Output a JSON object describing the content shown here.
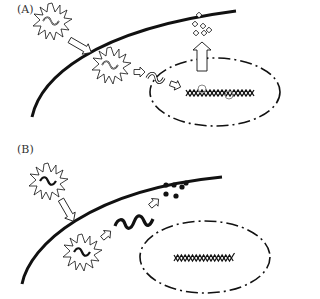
{
  "panels": [
    {
      "label": "(A)",
      "description": "Virus particle enters cell, releases genome which integrates into host DNA in nucleus; progeny particles released",
      "elements": [
        "virus-particle-outside",
        "entry-arrow",
        "virus-particle-inside",
        "genome-release-arrow",
        "viral-genome",
        "nuclear-entry-arrow",
        "host-dna-with-integration",
        "export-arrow",
        "progeny-particles"
      ]
    },
    {
      "label": "(B)",
      "description": "Virus particle enters cell, releases genome which is degraded in cytoplasm; host DNA in nucleus unchanged",
      "elements": [
        "virus-particle-outside",
        "entry-arrow",
        "virus-particle-inside",
        "genome-release-arrow",
        "viral-genome",
        "degradation-arrow",
        "degraded-fragments",
        "host-dna"
      ]
    }
  ],
  "colors": {
    "stroke": "#111111",
    "background": "#ffffff",
    "gray": "#888888"
  }
}
